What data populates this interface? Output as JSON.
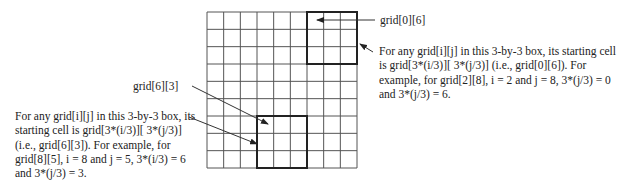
{
  "grid": {
    "rows": 9,
    "cols": 9,
    "highlighted_boxes": [
      {
        "name": "box-top-right",
        "start_row": 0,
        "start_col": 6,
        "size": 3
      },
      {
        "name": "box-bottom-middle",
        "start_row": 6,
        "start_col": 3,
        "size": 3
      }
    ],
    "line_color": "#555555",
    "box_color": "#222222"
  },
  "labels": {
    "top_cell": "grid[0][6]",
    "bottom_cell": "grid[6][3]"
  },
  "notes": {
    "right": "For any grid[i][j] in this 3-by-3 box, its starting cell\nis grid[3*(i/3)][ 3*(j/3)] (i.e., grid[0][6]). For\nexample, for grid[2][8], i = 2 and j = 8, 3*(j/3) = 0\nand 3*(j/3) = 6.",
    "left": "For any grid[i][j] in this 3-by-3 box, its\nstarting cell is grid[3*(i/3)][ 3*(j/3)]\n(i.e., grid[6][3]). For example, for\ngrid[8][5], i = 8 and j = 5, 3*(i/3) = 6\nand 3*(j/3) = 3."
  }
}
